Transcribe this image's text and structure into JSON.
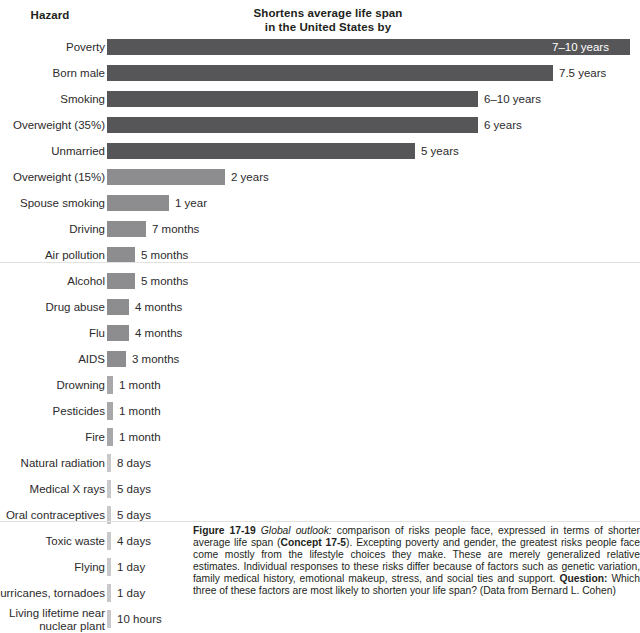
{
  "header": {
    "hazard_label": "Hazard",
    "value_label_line1": "Shortens average life span",
    "value_label_line2": "in the United States by"
  },
  "caption": {
    "figure_number": "Figure 17-19",
    "lead_italic": "Global outlook:",
    "text_part1": " comparison of risks people face, expressed in terms of shorter average life span (",
    "concept_ref": "Concept 17-5",
    "text_part2": "). Excepting poverty and gender, the greatest risks people face come mostly from the lifestyle choices they make. These are merely generalized relative estimates. Individual responses to these risks differ because of factors such as genetic variation, family medical history, emotional makeup, stress, and social ties and support. ",
    "question_label": "Question:",
    "text_part3": " Which three of these factors are most likely to shorten your life span? (Data from Bernard L. Cohen)"
  },
  "colors": {
    "bar_dark": "#565658",
    "bar_mid": "#8d8d8f",
    "bar_light": "#a8a8aa",
    "bar_pale": "#c9c9cb",
    "text": "#231f20",
    "inside_label": "#ffffff",
    "background": "#ffffff"
  },
  "chart_data": {
    "type": "bar",
    "orientation": "horizontal",
    "title": "Shortens average life span in the United States by",
    "xlabel": "",
    "ylabel": "Hazard",
    "grid": false,
    "legend": "none",
    "categories": [
      "Poverty",
      "Born male",
      "Smoking",
      "Overweight (35%)",
      "Unmarried",
      "Overweight (15%)",
      "Spouse smoking",
      "Driving",
      "Air pollution",
      "Alcohol",
      "Drug abuse",
      "Flu",
      "AIDS",
      "Drowning",
      "Pesticides",
      "Fire",
      "Natural radiation",
      "Medical X rays",
      "Oral contraceptives",
      "Toxic waste",
      "Flying",
      "Hurricanes, tornadoes",
      "Living lifetime near nuclear plant"
    ],
    "value_labels": [
      "7–10 years",
      "7.5 years",
      "6–10 years",
      "6 years",
      "5 years",
      "2 years",
      "1 year",
      "7 months",
      "5 months",
      "5 months",
      "4 months",
      "4 months",
      "3 months",
      "1 month",
      "1 month",
      "1 month",
      "8 days",
      "5 days",
      "5 days",
      "4 days",
      "1 day",
      "1 day",
      "10 hours"
    ],
    "values_days": [
      3100,
      2738,
      2920,
      2190,
      1825,
      730,
      365,
      213,
      152,
      152,
      122,
      122,
      91,
      30,
      30,
      30,
      8,
      5,
      5,
      4,
      1,
      1,
      0.42
    ],
    "bars": [
      {
        "label": "Poverty",
        "value_label": "7–10 years",
        "width_px": 523,
        "shade": "dark",
        "label_inside": true
      },
      {
        "label": "Born male",
        "value_label": "7.5 years",
        "width_px": 446,
        "shade": "dark",
        "label_inside": false
      },
      {
        "label": "Smoking",
        "value_label": "6–10 years",
        "width_px": 371,
        "shade": "dark",
        "label_inside": false
      },
      {
        "label": "Overweight (35%)",
        "value_label": "6 years",
        "width_px": 371,
        "shade": "dark",
        "label_inside": false
      },
      {
        "label": "Unmarried",
        "value_label": "5 years",
        "width_px": 308,
        "shade": "dark",
        "label_inside": false
      },
      {
        "label": "Overweight (15%)",
        "value_label": "2 years",
        "width_px": 118,
        "shade": "mid",
        "label_inside": false
      },
      {
        "label": "Spouse smoking",
        "value_label": "1 year",
        "width_px": 62,
        "shade": "mid",
        "label_inside": false
      },
      {
        "label": "Driving",
        "value_label": "7 months",
        "width_px": 39,
        "shade": "mid",
        "label_inside": false
      },
      {
        "label": "Air pollution",
        "value_label": "5 months",
        "width_px": 28,
        "shade": "mid",
        "label_inside": false
      },
      {
        "label": "Alcohol",
        "value_label": "5 months",
        "width_px": 28,
        "shade": "mid",
        "label_inside": false
      },
      {
        "label": "Drug abuse",
        "value_label": "4 months",
        "width_px": 22,
        "shade": "mid",
        "label_inside": false
      },
      {
        "label": "Flu",
        "value_label": "4 months",
        "width_px": 22,
        "shade": "mid",
        "label_inside": false
      },
      {
        "label": "AIDS",
        "value_label": "3 months",
        "width_px": 19,
        "shade": "mid",
        "label_inside": false
      },
      {
        "label": "Drowning",
        "value_label": "1 month",
        "width_px": 6,
        "shade": "light",
        "label_inside": false
      },
      {
        "label": "Pesticides",
        "value_label": "1 month",
        "width_px": 6,
        "shade": "light",
        "label_inside": false
      },
      {
        "label": "Fire",
        "value_label": "1 month",
        "width_px": 6,
        "shade": "light",
        "label_inside": false
      },
      {
        "label": "Natural radiation",
        "value_label": "8 days",
        "width_px": 4,
        "shade": "pale",
        "label_inside": false
      },
      {
        "label": "Medical X rays",
        "value_label": "5 days",
        "width_px": 4,
        "shade": "pale",
        "label_inside": false
      },
      {
        "label": "Oral contraceptives",
        "value_label": "5 days",
        "width_px": 4,
        "shade": "pale",
        "label_inside": false
      },
      {
        "label": "Toxic waste",
        "value_label": "4 days",
        "width_px": 4,
        "shade": "pale",
        "label_inside": false
      },
      {
        "label": "Flying",
        "value_label": "1 day",
        "width_px": 4,
        "shade": "pale",
        "label_inside": false
      },
      {
        "label": "Hurricanes, tornadoes",
        "value_label": "1 day",
        "width_px": 4,
        "shade": "pale",
        "label_inside": false
      },
      {
        "label": "Living lifetime near nuclear plant",
        "value_label": "10 hours",
        "width_px": 4,
        "shade": "pale",
        "label_inside": false
      }
    ]
  }
}
